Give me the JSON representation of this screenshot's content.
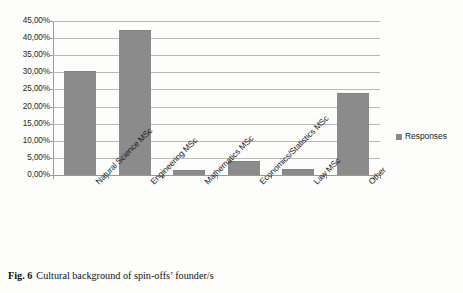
{
  "chart_data": {
    "type": "bar",
    "title": "",
    "subtitle": "",
    "xlabel": "",
    "ylabel": "",
    "categories": [
      "Natural Science MSc",
      "Engineering MSc",
      "Mathematics MSc",
      "Economics/Statistics MSc",
      "Law MSc",
      "Other"
    ],
    "series": [
      {
        "name": "Responses",
        "values": [
          30.2,
          42.0,
          1.3,
          3.8,
          1.6,
          23.7
        ],
        "color": "#8b8b8b"
      }
    ],
    "ylim": [
      0,
      45
    ],
    "ytick_values": [
      0,
      5,
      10,
      15,
      20,
      25,
      30,
      35,
      40,
      45
    ],
    "ytick_labels": [
      "0,00%",
      "5,00%",
      "10,00%",
      "15,00%",
      "20,00%",
      "25,00%",
      "30,00%",
      "35,00%",
      "40,00%",
      "45,00%"
    ],
    "grid": true,
    "grid_axis": "y",
    "legend": {
      "position": "right",
      "entries": [
        {
          "label": "Responses",
          "color": "#8b8b8b",
          "marker": "square"
        }
      ]
    },
    "value_format": "percent-comma-decimal"
  },
  "legend": {
    "label": "Responses",
    "swatch_icon": "legend-square-icon"
  },
  "caption": {
    "number": "Fig. 6",
    "text": "Cultural background of spin-offs’ founder/s"
  },
  "colors": {
    "bar": "#8b8b8b",
    "gridline": "#b9b9b9",
    "axis": "#9a9a9a",
    "background": "#fdfdfc",
    "text": "#1a1a1a"
  }
}
